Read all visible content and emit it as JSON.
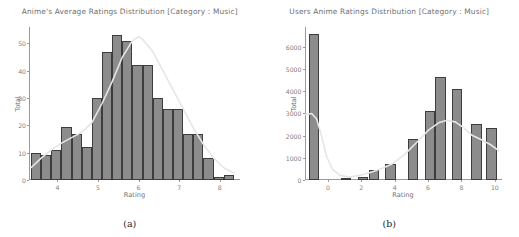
{
  "figure": {
    "width": 519,
    "height": 237,
    "background": "#ffffff",
    "bar_fill": "#8c8c8c",
    "bar_edge": "#3d3d3d",
    "kde_color": "#e8e8e8",
    "axis_color": "#9a9a9a",
    "text_color": "#6f6f6f"
  },
  "panels": [
    {
      "id": "panel-a",
      "subcaption": "(a)",
      "chart_data": {
        "type": "bar",
        "title": "Anime's Average Ratings Distribution [Category : Music]",
        "xlabel": "Rating",
        "ylabel": "Total",
        "grid": false,
        "legend": "none",
        "xlim": [
          3.3,
          8.5
        ],
        "ylim": [
          0,
          56
        ],
        "xticks": [
          4,
          5,
          6,
          7,
          8
        ],
        "xtick_labels": [
          "4",
          "5",
          "6",
          "7",
          "8"
        ],
        "yticks": [
          0,
          10,
          20,
          30,
          40,
          50
        ],
        "ytick_labels": [
          "0",
          "10",
          "20",
          "30",
          "40",
          "50"
        ],
        "bin_edges": [
          3.35,
          3.6,
          3.85,
          4.1,
          4.35,
          4.6,
          4.85,
          5.1,
          5.35,
          5.6,
          5.85,
          6.1,
          6.35,
          6.6,
          6.85,
          7.1,
          7.35,
          7.6,
          7.85,
          8.1,
          8.35
        ],
        "bin_centers": [
          3.48,
          3.73,
          3.98,
          4.23,
          4.48,
          4.73,
          4.98,
          5.23,
          5.48,
          5.73,
          5.98,
          6.23,
          6.48,
          6.73,
          6.98,
          7.23,
          7.48,
          7.73,
          7.98,
          8.23
        ],
        "values": [
          10,
          9,
          11,
          19.5,
          17,
          12,
          30,
          47,
          53,
          51,
          42,
          42,
          30,
          26,
          26,
          17,
          17,
          8,
          1,
          2
        ],
        "kde_curve": [
          {
            "x": 3.35,
            "y": 4.5
          },
          {
            "x": 3.6,
            "y": 8
          },
          {
            "x": 3.85,
            "y": 11
          },
          {
            "x": 4.1,
            "y": 13.5
          },
          {
            "x": 4.35,
            "y": 15.5
          },
          {
            "x": 4.6,
            "y": 17.5
          },
          {
            "x": 4.85,
            "y": 21
          },
          {
            "x": 5.1,
            "y": 28
          },
          {
            "x": 5.35,
            "y": 36
          },
          {
            "x": 5.6,
            "y": 45
          },
          {
            "x": 5.85,
            "y": 51
          },
          {
            "x": 6.0,
            "y": 52.5
          },
          {
            "x": 6.1,
            "y": 51.5
          },
          {
            "x": 6.35,
            "y": 47
          },
          {
            "x": 6.6,
            "y": 40
          },
          {
            "x": 6.85,
            "y": 33
          },
          {
            "x": 7.1,
            "y": 26
          },
          {
            "x": 7.35,
            "y": 19
          },
          {
            "x": 7.6,
            "y": 13
          },
          {
            "x": 7.85,
            "y": 8
          },
          {
            "x": 8.1,
            "y": 4.5
          },
          {
            "x": 8.35,
            "y": 2.5
          }
        ]
      }
    },
    {
      "id": "panel-b",
      "subcaption": "(b)",
      "chart_data": {
        "type": "bar",
        "title": "Users Anime Ratings Distribution [Category : Music]",
        "xlabel": "Rating",
        "ylabel": "Total",
        "grid": false,
        "legend": "none",
        "xlim": [
          -1.4,
          10.4
        ],
        "ylim": [
          0,
          6900
        ],
        "xticks": [
          0,
          2,
          4,
          6,
          8,
          10
        ],
        "xtick_labels": [
          "0",
          "2",
          "4",
          "6",
          "8",
          "10"
        ],
        "yticks": [
          0,
          1000,
          2000,
          3000,
          4000,
          5000,
          6000
        ],
        "ytick_labels": [
          "0",
          "1000",
          "2000",
          "3000",
          "4000",
          "5000",
          "6000"
        ],
        "bin_centers": [
          -0.85,
          1.1,
          2.1,
          2.75,
          3.75,
          5.1,
          6.1,
          6.75,
          7.75,
          8.9,
          9.8
        ],
        "bar_width": 0.62,
        "values": [
          6600,
          90,
          140,
          430,
          710,
          1850,
          3100,
          4650,
          4100,
          2520,
          2350
        ],
        "kde_curve": [
          {
            "x": -1.35,
            "y": 2950
          },
          {
            "x": -1.0,
            "y": 3000
          },
          {
            "x": -0.7,
            "y": 2750
          },
          {
            "x": -0.4,
            "y": 1950
          },
          {
            "x": -0.1,
            "y": 1050
          },
          {
            "x": 0.25,
            "y": 480
          },
          {
            "x": 0.7,
            "y": 210
          },
          {
            "x": 1.3,
            "y": 130
          },
          {
            "x": 2.0,
            "y": 230
          },
          {
            "x": 2.6,
            "y": 360
          },
          {
            "x": 3.2,
            "y": 520
          },
          {
            "x": 3.9,
            "y": 760
          },
          {
            "x": 4.6,
            "y": 1180
          },
          {
            "x": 5.3,
            "y": 1700
          },
          {
            "x": 6.0,
            "y": 2250
          },
          {
            "x": 6.6,
            "y": 2580
          },
          {
            "x": 7.1,
            "y": 2690
          },
          {
            "x": 7.6,
            "y": 2620
          },
          {
            "x": 8.1,
            "y": 2360
          },
          {
            "x": 8.6,
            "y": 2020
          },
          {
            "x": 9.2,
            "y": 1800
          },
          {
            "x": 9.7,
            "y": 1600
          },
          {
            "x": 10.2,
            "y": 1330
          }
        ]
      }
    }
  ]
}
